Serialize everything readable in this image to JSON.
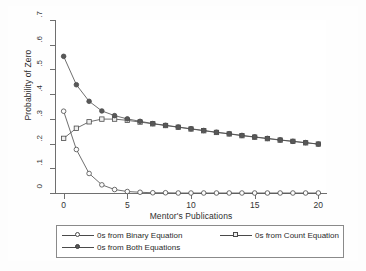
{
  "chart_data": {
    "type": "line",
    "title": "",
    "xlabel": "Mentor's Publications",
    "ylabel": "Probability of Zero",
    "xlim": [
      -0.6,
      20.6
    ],
    "ylim": [
      0,
      0.7
    ],
    "xticks": [
      "0",
      "5",
      "10",
      "15",
      "20"
    ],
    "xtick_values": [
      0,
      5,
      10,
      15,
      20
    ],
    "yticks": [
      "0",
      ".1",
      ".2",
      ".3",
      ".4",
      ".5",
      ".6",
      ".7"
    ],
    "ytick_values": [
      0,
      0.1,
      0.2,
      0.3,
      0.4,
      0.5,
      0.6,
      0.7
    ],
    "grid": false,
    "legend_position": "below",
    "x": [
      0,
      1,
      2,
      3,
      4,
      5,
      6,
      7,
      8,
      9,
      10,
      11,
      12,
      13,
      14,
      15,
      16,
      17,
      18,
      19,
      20
    ],
    "series": [
      {
        "name": "0s from Binary Equation",
        "marker": "circle-open",
        "values": [
          0.331,
          0.176,
          0.079,
          0.033,
          0.014,
          0.006,
          0.003,
          0.001,
          0.001,
          0.0,
          0.0,
          0.0,
          0.0,
          0.0,
          0.0,
          0.0,
          0.0,
          0.0,
          0.0,
          0.0,
          0.0
        ]
      },
      {
        "name": "0s from Count Equation",
        "marker": "square-open",
        "values": [
          0.221,
          0.262,
          0.288,
          0.299,
          0.299,
          0.294,
          0.287,
          0.28,
          0.273,
          0.266,
          0.259,
          0.252,
          0.245,
          0.239,
          0.232,
          0.226,
          0.22,
          0.214,
          0.209,
          0.203,
          0.198
        ]
      },
      {
        "name": "0s from Both Equations",
        "marker": "circle-filled",
        "values": [
          0.553,
          0.438,
          0.371,
          0.332,
          0.313,
          0.3,
          0.29,
          0.281,
          0.274,
          0.267,
          0.26,
          0.253,
          0.246,
          0.24,
          0.233,
          0.227,
          0.221,
          0.215,
          0.209,
          0.204,
          0.198
        ]
      }
    ],
    "colors": {
      "line": "#4a4a4a",
      "marker_open_fill": "#fdfdfd",
      "marker_square_fill": "#efefef",
      "marker_filled_fill": "#585858",
      "axis": "#6f6f6f",
      "plot_background": "#ffffff",
      "graph_background": "#fefefe"
    }
  },
  "legend": {
    "entries": [
      {
        "label": "0s from Binary Equation"
      },
      {
        "label": "0s from Count Equation"
      },
      {
        "label": "0s from Both Equations"
      }
    ]
  }
}
